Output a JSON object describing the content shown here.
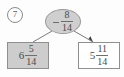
{
  "problem": {
    "number": "7"
  },
  "diagram": {
    "type": "subtraction-tree",
    "root": {
      "operator": "−",
      "numerator": "8",
      "denominator": "14",
      "fill_color": "#cfcfcf",
      "shape": "oval"
    },
    "children": [
      {
        "position": "left",
        "whole": "6",
        "numerator": "5",
        "denominator": "14",
        "fill_color": "#cdcdcd",
        "shape": "rectangle",
        "has_arrow": false
      },
      {
        "position": "right",
        "whole": "5",
        "numerator": "11",
        "denominator": "14",
        "fill_color": "#ffffff",
        "shape": "rectangle",
        "has_arrow": true
      }
    ],
    "line_color": "#7a7a7a",
    "border_color": "#8f8f8f"
  }
}
